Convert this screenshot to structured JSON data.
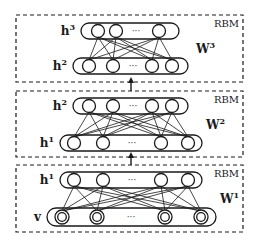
{
  "diagram": {
    "colors": {
      "stroke": "#1a1a1a",
      "background": "#ffffff"
    },
    "ellipsis": "···",
    "blocks": [
      {
        "label": "RBM",
        "box": {
          "x": 16,
          "y": 15,
          "w": 227,
          "h": 67
        },
        "weight": {
          "base": "W",
          "sup": "3"
        },
        "top_layer": {
          "name": {
            "base": "h",
            "sup": "3"
          },
          "pill": {
            "x": 81,
            "y": 23,
            "w": 98,
            "h": 16
          },
          "nodes": [
            98,
            116,
            159
          ],
          "dots_x": 136,
          "double": false
        },
        "bottom_layer": {
          "name": {
            "base": "h",
            "sup": "2"
          },
          "pill": {
            "x": 73,
            "y": 58,
            "w": 115,
            "h": 16
          },
          "nodes": [
            89,
            113,
            152,
            172
          ],
          "dots_x": 133,
          "double": false
        }
      },
      {
        "label": "RBM",
        "box": {
          "x": 16,
          "y": 91,
          "w": 227,
          "h": 66
        },
        "weight": {
          "base": "W",
          "sup": "2"
        },
        "top_layer": {
          "name": {
            "base": "h",
            "sup": "2"
          },
          "pill": {
            "x": 73,
            "y": 98,
            "w": 115,
            "h": 16
          },
          "nodes": [
            89,
            113,
            152,
            172
          ],
          "dots_x": 133,
          "double": false
        },
        "bottom_layer": {
          "name": {
            "base": "h",
            "sup": "1"
          },
          "pill": {
            "x": 60,
            "y": 135,
            "w": 142,
            "h": 16
          },
          "nodes": [
            74,
            103,
            161,
            188
          ],
          "dots_x": 132,
          "double": false
        }
      },
      {
        "label": "RBM",
        "box": {
          "x": 16,
          "y": 165,
          "w": 227,
          "h": 67
        },
        "weight": {
          "base": "W",
          "sup": "1"
        },
        "top_layer": {
          "name": {
            "base": "h",
            "sup": "1"
          },
          "pill": {
            "x": 60,
            "y": 172,
            "w": 142,
            "h": 16
          },
          "nodes": [
            74,
            103,
            161,
            188
          ],
          "dots_x": 132,
          "double": false
        },
        "bottom_layer": {
          "name": {
            "base": "v",
            "sup": ""
          },
          "pill": {
            "x": 47,
            "y": 208,
            "w": 169,
            "h": 18
          },
          "nodes": [
            62,
            97,
            165,
            201
          ],
          "dots_x": 131,
          "double": true
        }
      }
    ],
    "arrows": [
      {
        "x": 131,
        "y1": 91,
        "y2": 77
      },
      {
        "x": 131,
        "y1": 165,
        "y2": 152
      }
    ]
  }
}
